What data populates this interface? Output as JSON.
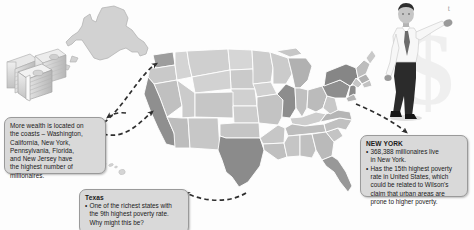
{
  "page": {
    "background_color": "#fdfdfd",
    "corner_mark": "t"
  },
  "callouts": {
    "wealth": {
      "name": "wealth-coasts-callout",
      "body": "More wealth is located on the coasts –  Washington, California, New York, Pennsylvania, Florida, and New Jersey have the highest number of millionaires.",
      "lines": [
        "More wealth is located on",
        "the coasts –  Washington,",
        "California, New York,",
        "Pennsylvania, Florida,",
        "and New Jersey have",
        "the highest number of",
        "millionaires."
      ],
      "fill_color": "#d9d9d9",
      "border_color": "#9a9a9a"
    },
    "texas": {
      "name": "texas-callout",
      "title": "Texas",
      "bullets": [
        {
          "lines": [
            "One of the richest states with",
            "the 9th highest poverty rate.",
            "Why might this be?"
          ]
        }
      ],
      "fill_color": "#d9d9d9",
      "border_color": "#9a9a9a"
    },
    "newyork": {
      "name": "new-york-callout",
      "title": "NEW YORK",
      "bullets": [
        {
          "lines": [
            "368,388 millionaires live",
            "in New York."
          ]
        },
        {
          "lines": [
            "Has the 15th highest poverty",
            "rate in United States, which",
            "could be related to Wilson's",
            "claim that urban areas are",
            "prone to higher poverty."
          ]
        }
      ],
      "fill_color": "#d9d9d9",
      "border_color": "#9a9a9a"
    }
  },
  "map": {
    "name": "us-choropleth-map",
    "type": "choropleth",
    "title": "United States millionaire / wealth distribution map",
    "legend_shown": false,
    "shade_scale": {
      "darkest": "#808080",
      "dark": "#949494",
      "medium": "#aeaeae",
      "light": "#c4c4c4",
      "lightest": "#d8d8d8"
    },
    "highlighted_states": [
      "California",
      "Texas",
      "New York",
      "Pennsylvania",
      "Florida",
      "Illinois",
      "New Jersey",
      "Washington"
    ],
    "insets": [
      "Alaska",
      "Hawaii"
    ]
  },
  "illustrations": {
    "money": {
      "name": "money-stack-illustration",
      "label": "stacks of banknotes"
    },
    "businessman": {
      "name": "businessman-illustration",
      "label": "businessman leaning with raised arm"
    },
    "dollar_sign": {
      "name": "dollar-sign-watermark",
      "label": "large faded dollar sign"
    }
  },
  "arrows": {
    "name": "dashed-connector-arrows",
    "count": 4,
    "style": "dashed curved with arrowhead",
    "color": "#3a3a3a"
  }
}
